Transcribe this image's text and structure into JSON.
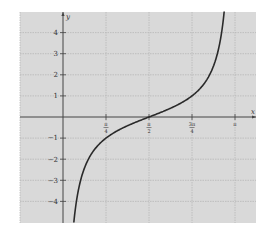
{
  "chart_data": {
    "type": "line",
    "title": "",
    "xlabel": "x",
    "ylabel": "y",
    "function": "y = -cot(x)",
    "x_ticks": [
      {
        "value": 0.7853981634,
        "label": "π/4",
        "num": "π",
        "den": "4"
      },
      {
        "value": 1.5707963268,
        "label": "π/2",
        "num": "π",
        "den": "2"
      },
      {
        "value": 2.3561944902,
        "label": "3π/4",
        "num": "3π",
        "den": "4"
      },
      {
        "value": 3.1415926536,
        "label": "π",
        "num": "π",
        "den": ""
      }
    ],
    "y_ticks": [
      -4,
      -3,
      -2,
      -1,
      1,
      2,
      3,
      4
    ],
    "xlim": [
      -1.0,
      3.45
    ],
    "ylim": [
      -5.0,
      5.0
    ],
    "grid": true,
    "asymptotes": [
      0,
      3.1415926536
    ],
    "series": [
      {
        "name": "-cot(x)",
        "x": [
          0.197,
          0.245,
          0.32,
          0.46,
          0.6,
          0.785,
          1.0,
          1.2,
          1.3,
          1.4,
          1.571,
          1.7,
          1.85,
          2.0,
          2.2,
          2.356,
          2.5,
          2.65,
          2.8,
          2.9,
          2.95
        ],
        "values": [
          -5.0,
          -4.0,
          -3.0,
          -2.0,
          -1.46,
          -1.0,
          -0.64,
          -0.39,
          -0.28,
          -0.17,
          0.0,
          0.13,
          0.29,
          0.46,
          0.73,
          1.0,
          1.34,
          1.87,
          2.81,
          4.0,
          5.0
        ]
      }
    ],
    "legend": null
  },
  "colors": {
    "background": "#ffffff",
    "plot_area": "#d9d9d9",
    "grid": "#b8b8b8",
    "axis": "#444444",
    "curve": "#2a2a2a"
  }
}
